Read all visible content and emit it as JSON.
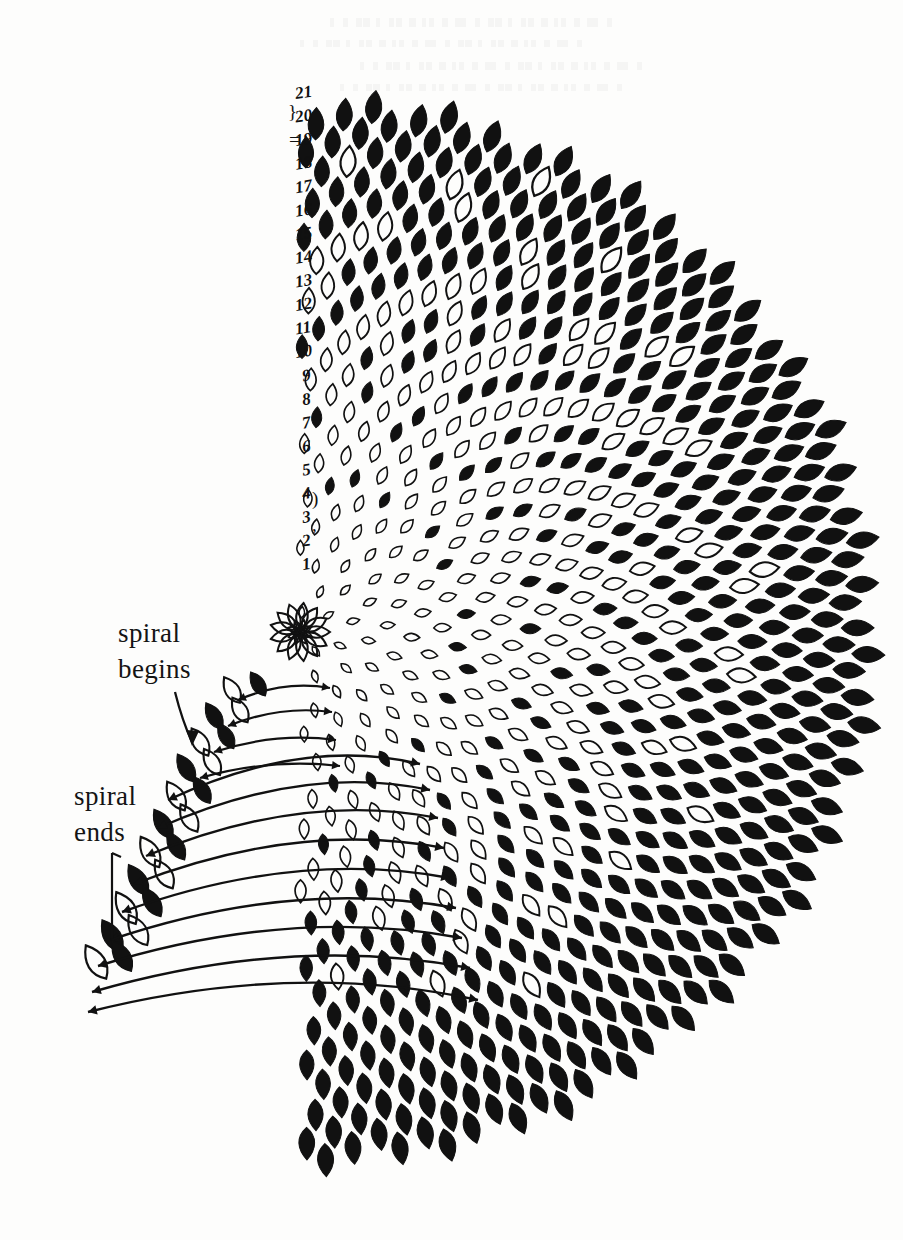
{
  "figure": {
    "background_color": "#fdfdfc",
    "ink_color": "#111111",
    "kind": "botanical phyllotaxis diagram"
  },
  "annotations": {
    "spiral_begins": {
      "line1": "spiral",
      "line2": "begins",
      "pointer": "arrow-down-right"
    },
    "spiral_ends": {
      "line1": "spiral",
      "line2": "ends",
      "pointer": "vertical-bracket"
    }
  },
  "row_numbers": {
    "label_note": "handwritten row indices along left margin, bottom to top",
    "values": [
      "1",
      "2",
      "3",
      "4",
      "5",
      "6",
      "7",
      "8",
      "9",
      "10",
      "11",
      "12",
      "13",
      "14",
      "15",
      "16",
      "17",
      "18",
      "19",
      "20",
      "21"
    ],
    "brace_marks": [
      "}",
      "=",
      ")",
      ","
    ]
  },
  "chart_data": {
    "type": "scatter",
    "title": "",
    "xlabel": "",
    "ylabel": "",
    "origin": [
      300,
      632
    ],
    "radius_max": 575,
    "angle_range_deg": [
      -90,
      90
    ],
    "divergence_angle_deg": 137.507,
    "floret_count": 1450,
    "parastichy_counts": [
      21,
      34,
      55
    ],
    "fill_states": [
      "filled",
      "outlined"
    ],
    "numbered_rows": 21,
    "ylim": [
      85,
      1160
    ],
    "xlim": [
      55,
      875
    ],
    "grid": false,
    "legend": "none"
  }
}
